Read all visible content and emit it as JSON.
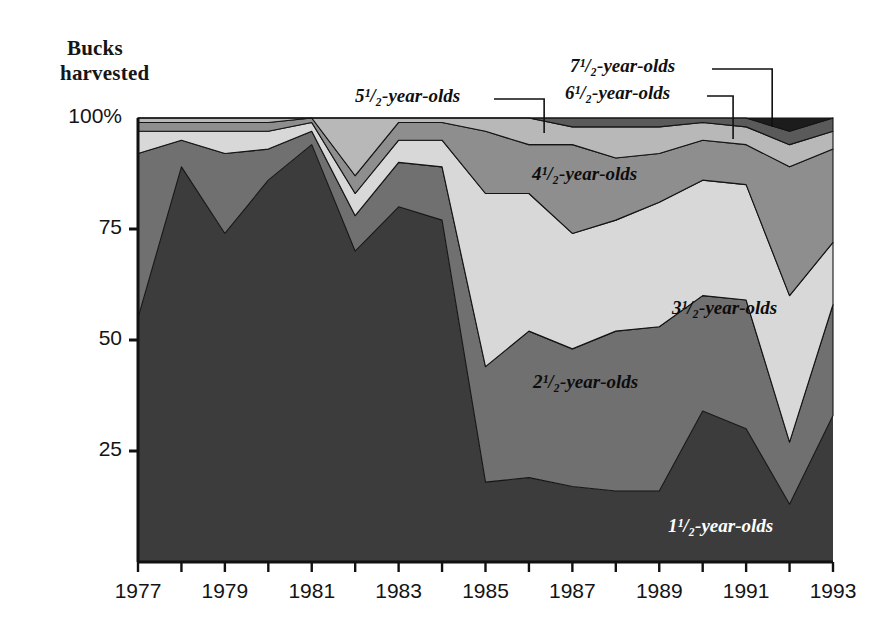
{
  "axis_title": {
    "line1": "Bucks",
    "line2": "harvested"
  },
  "yaxis": {
    "ticks": [
      "100%",
      "75",
      "50",
      "25"
    ],
    "tick_values": [
      100,
      75,
      50,
      25
    ],
    "min": 0,
    "max": 100
  },
  "xaxis": {
    "labels": [
      "1977",
      "1979",
      "1981",
      "1983",
      "1985",
      "1987",
      "1989",
      "1991",
      "1993"
    ],
    "label_values": [
      1977,
      1979,
      1981,
      1983,
      1985,
      1987,
      1989,
      1991,
      1993
    ],
    "min": 1977,
    "max": 1993
  },
  "callouts": [
    {
      "id": "five-half",
      "label": "5¹/₂-year-olds",
      "leader_year": 1986.35
    },
    {
      "id": "six-half",
      "label": "6¹/₂-year-olds",
      "leader_year": 1990.7
    },
    {
      "id": "seven-half",
      "label": "7¹/₂-year-olds",
      "leader_year": 1991.6
    }
  ],
  "inner_labels": [
    {
      "id": "four-half",
      "label": "4¹/₂-year-olds"
    },
    {
      "id": "three-half",
      "label": "3¹/₂-year-olds"
    },
    {
      "id": "two-half",
      "label": "2¹/₂-year-olds"
    },
    {
      "id": "one-half",
      "label": "1¹/₂-year-olds"
    }
  ],
  "colors": {
    "band_1_5": "#3c3c3c",
    "band_2_5": "#707070",
    "band_3_5": "#d8d8d8",
    "band_4_5": "#8e8e8e",
    "band_5_5": "#b8b8b8",
    "band_6_5": "#5a5a5a",
    "band_7_5": "#1c1c1c",
    "axis": "#111111",
    "background": "#ffffff"
  },
  "chart_data": {
    "type": "area",
    "stacked": true,
    "normalized": true,
    "title": "Bucks harvested",
    "xlabel": "",
    "ylabel": "Bucks harvested",
    "ylim": [
      0,
      100
    ],
    "xlim": [
      1977,
      1993
    ],
    "grid": false,
    "legend": "in-plot labels with leader lines",
    "x": [
      1977,
      1978,
      1979,
      1980,
      1981,
      1982,
      1983,
      1984,
      1985,
      1986,
      1987,
      1988,
      1989,
      1990,
      1991,
      1992,
      1993
    ],
    "categories": [
      "1977",
      "1978",
      "1979",
      "1980",
      "1981",
      "1982",
      "1983",
      "1984",
      "1985",
      "1986",
      "1987",
      "1988",
      "1989",
      "1990",
      "1991",
      "1992",
      "1993"
    ],
    "series": [
      {
        "name": "1½-year-olds",
        "color": "#3c3c3c",
        "values": [
          55,
          89,
          74,
          86,
          94,
          70,
          80,
          77,
          18,
          19,
          17,
          16,
          16,
          34,
          30,
          13,
          33
        ]
      },
      {
        "name": "2½-year-olds",
        "color": "#707070",
        "values": [
          37,
          6,
          18,
          7,
          3,
          8,
          10,
          12,
          26,
          33,
          31,
          36,
          37,
          26,
          29,
          14,
          25
        ]
      },
      {
        "name": "3½-year-olds",
        "color": "#d8d8d8",
        "values": [
          5,
          2,
          5,
          4,
          2,
          5,
          5,
          6,
          39,
          31,
          26,
          25,
          28,
          26,
          26,
          33,
          14
        ]
      },
      {
        "name": "4½-year-olds",
        "color": "#8e8e8e",
        "values": [
          2,
          2,
          2,
          2,
          1,
          4,
          4,
          4,
          14,
          11,
          20,
          14,
          11,
          9,
          9,
          29,
          21
        ]
      },
      {
        "name": "5½-year-olds",
        "color": "#b8b8b8",
        "values": [
          1,
          1,
          1,
          1,
          0,
          13,
          1,
          1,
          3,
          6,
          4,
          7,
          6,
          4,
          4,
          5,
          4
        ]
      },
      {
        "name": "6½-year-olds",
        "color": "#5a5a5a",
        "values": [
          0,
          0,
          0,
          0,
          0,
          0,
          0,
          0,
          0,
          0,
          2,
          2,
          2,
          1,
          2,
          3,
          3
        ]
      },
      {
        "name": "7½-year-olds",
        "color": "#1c1c1c",
        "values": [
          0,
          0,
          0,
          0,
          0,
          0,
          0,
          0,
          0,
          0,
          0,
          0,
          0,
          0,
          0,
          3,
          0
        ]
      }
    ]
  }
}
